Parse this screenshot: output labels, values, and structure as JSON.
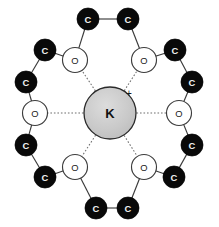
{
  "figure": {
    "background_color": "#ffffff",
    "width": 219,
    "height": 227
  },
  "chart_data": {
    "type": "diagram",
    "colors": {
      "carbon_fill": "#090909",
      "carbon_label": "#f2f2f2",
      "oxygen_fill": "#ffffff",
      "oxygen_stroke": "#3c3c3c",
      "cation_fill": "#c9c9c9",
      "cation_stroke": "#2a2a2a",
      "bond_stroke": "#3a3a3a",
      "coordination_stroke": "#6e6e6e",
      "background": "#ffffff"
    },
    "center": {
      "label": "K",
      "charge": "+",
      "element": "potassium",
      "x": 110,
      "y": 113,
      "r": 26
    },
    "oxygens": [
      {
        "id": "O1",
        "label": "O",
        "x": 75,
        "y": 60,
        "r": 12.5
      },
      {
        "id": "O2",
        "label": "O",
        "x": 144,
        "y": 60,
        "r": 12.5
      },
      {
        "id": "O3",
        "label": "O",
        "x": 179,
        "y": 113,
        "r": 12.5
      },
      {
        "id": "O4",
        "label": "O",
        "x": 144,
        "y": 167,
        "r": 12.5
      },
      {
        "id": "O5",
        "label": "O",
        "x": 75,
        "y": 167,
        "r": 12.5
      },
      {
        "id": "O6",
        "label": "O",
        "x": 35,
        "y": 113,
        "r": 12.5
      }
    ],
    "carbons": [
      {
        "id": "C1",
        "label": "C",
        "x": 88,
        "y": 19,
        "r": 11
      },
      {
        "id": "C2",
        "label": "C",
        "x": 128,
        "y": 19,
        "r": 11
      },
      {
        "id": "C3",
        "label": "C",
        "x": 175,
        "y": 50,
        "r": 11
      },
      {
        "id": "C4",
        "label": "C",
        "x": 192,
        "y": 82,
        "r": 11
      },
      {
        "id": "C5",
        "label": "C",
        "x": 192,
        "y": 145,
        "r": 11
      },
      {
        "id": "C6",
        "label": "C",
        "x": 174,
        "y": 177,
        "r": 11
      },
      {
        "id": "C7",
        "label": "C",
        "x": 128,
        "y": 208,
        "r": 11
      },
      {
        "id": "C8",
        "label": "C",
        "x": 96,
        "y": 208,
        "r": 11
      },
      {
        "id": "C9",
        "label": "C",
        "x": 45,
        "y": 177,
        "r": 11
      },
      {
        "id": "C10",
        "label": "C",
        "x": 26,
        "y": 145,
        "r": 11
      },
      {
        "id": "C11",
        "label": "C",
        "x": 26,
        "y": 82,
        "r": 11
      },
      {
        "id": "C12",
        "label": "C",
        "x": 45,
        "y": 50,
        "r": 11
      }
    ],
    "covalent_bonds": [
      {
        "from": "O1",
        "to": "C1"
      },
      {
        "from": "C1",
        "to": "C2"
      },
      {
        "from": "C2",
        "to": "O2"
      },
      {
        "from": "O2",
        "to": "C3"
      },
      {
        "from": "C3",
        "to": "C4"
      },
      {
        "from": "C4",
        "to": "O3"
      },
      {
        "from": "O3",
        "to": "C5"
      },
      {
        "from": "C5",
        "to": "C6"
      },
      {
        "from": "C6",
        "to": "O4"
      },
      {
        "from": "O4",
        "to": "C7"
      },
      {
        "from": "C7",
        "to": "C8"
      },
      {
        "from": "C8",
        "to": "O5"
      },
      {
        "from": "O5",
        "to": "C9"
      },
      {
        "from": "C9",
        "to": "C10"
      },
      {
        "from": "C10",
        "to": "O6"
      },
      {
        "from": "O6",
        "to": "C11"
      },
      {
        "from": "C11",
        "to": "C12"
      },
      {
        "from": "C12",
        "to": "O1"
      }
    ],
    "coordination_bonds": [
      {
        "from": "K",
        "to": "O1"
      },
      {
        "from": "K",
        "to": "O2"
      },
      {
        "from": "K",
        "to": "O3"
      },
      {
        "from": "K",
        "to": "O4"
      },
      {
        "from": "K",
        "to": "O5"
      },
      {
        "from": "K",
        "to": "O6"
      }
    ],
    "charge_marker": {
      "label": "+",
      "x": 129,
      "y": 93
    },
    "counts": {
      "oxygen": 6,
      "carbon": 12,
      "cation": 1
    }
  }
}
